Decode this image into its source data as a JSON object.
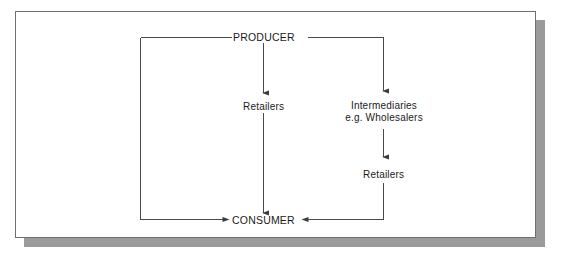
{
  "diagram": {
    "type": "flowchart",
    "nodes": [
      {
        "id": "producer",
        "label": "PRODUCER",
        "style": "caps",
        "x": 262,
        "y": 35
      },
      {
        "id": "retailers-direct",
        "label": "Retailers",
        "style": "normal",
        "x": 262,
        "y": 105
      },
      {
        "id": "intermediaries",
        "label_line1": "Intermediaries",
        "label_line2": "e.g. Wholesalers",
        "style": "normal",
        "x": 384,
        "y": 111
      },
      {
        "id": "retailers-indirect",
        "label": "Retailers",
        "style": "normal",
        "x": 382,
        "y": 173
      },
      {
        "id": "consumer",
        "label": "CONSUMER",
        "style": "caps",
        "x": 262,
        "y": 219
      }
    ],
    "edges": [
      {
        "id": "producer-to-retailers",
        "from": "producer",
        "to": "retailers-direct",
        "shape": "vertical",
        "arrow": true
      },
      {
        "id": "producer-to-intermediaries",
        "from": "producer",
        "to": "intermediaries",
        "shape": "elbow-right",
        "arrow": true
      },
      {
        "id": "producer-to-consumer",
        "from": "producer",
        "to": "consumer",
        "shape": "elbow-left",
        "arrow": true
      },
      {
        "id": "intermediaries-to-retailers",
        "from": "intermediaries",
        "to": "retailers-indirect",
        "shape": "vertical",
        "arrow": true
      },
      {
        "id": "retailers-to-consumer",
        "from": "retailers-direct",
        "to": "consumer",
        "shape": "vertical",
        "arrow": true
      },
      {
        "id": "retailers2-to-consumer",
        "from": "retailers-indirect",
        "to": "consumer",
        "shape": "elbow-right-in",
        "arrow": true
      }
    ],
    "colors": {
      "line": "#4a4a4a",
      "text": "#1a1a1a",
      "frame": "#6e6e6e",
      "shadow": "#9a9a9a",
      "background": "#ffffff"
    }
  }
}
